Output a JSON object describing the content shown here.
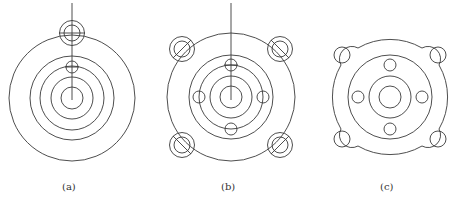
{
  "figures": [
    {
      "id": "a",
      "caption": "(a)",
      "description": "Concentric circles with small bolt circle on outer rim and a small hole on an inner ring; vertical construction line"
    },
    {
      "id": "b",
      "caption": "(b)",
      "description": "Concentric circles with four small holes on inner ring and four corner bolt holes with diagonal centerlines; vertical construction line"
    },
    {
      "id": "c",
      "caption": "(c)",
      "description": "Final flange outline with four lugs, four corner holes, four inner holes and central bore"
    }
  ],
  "colors": {
    "stroke": "#3a3a3a",
    "background": "#ffffff"
  }
}
